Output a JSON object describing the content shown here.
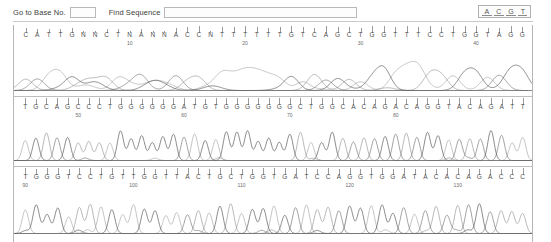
{
  "toolbar": {
    "goto_label": "Go to Base No.",
    "goto_value": "",
    "goto_placeholder": "",
    "find_label": "Find Sequence",
    "find_value": "",
    "find_placeholder": "",
    "nucleotide_buttons": [
      {
        "name": "adenine-button",
        "label": "A"
      },
      {
        "name": "cytosine-button",
        "label": "C"
      },
      {
        "name": "guanine-button",
        "label": "G"
      },
      {
        "name": "thymine-button",
        "label": "T"
      }
    ]
  },
  "accent_colors": {
    "trace_a": "#6e6e6e",
    "trace_c": "#8f8f8f",
    "trace_g": "#4a4a4a",
    "trace_t": "#a3a3a3",
    "panel_border": "#b6b6b6",
    "text": "#4f4f4f"
  },
  "chart_data": {
    "type": "line",
    "title": "",
    "xlabel": "Base number",
    "ylabel": "Fluorescence intensity",
    "grid": false,
    "legend": "none",
    "rows": [
      {
        "row": 1,
        "start_base": 1,
        "end_base": 45,
        "tick_labels": [
          10,
          20,
          30,
          40
        ],
        "sequence": "CATTGNNCTNANNACCNTTTTTGTCAGCTGGTTTCCTGGTAGG",
        "bases": [
          "C",
          "A",
          "T",
          "T",
          "G",
          "N",
          "N",
          "C",
          "T",
          "N",
          "A",
          "N",
          "N",
          "A",
          "C",
          "C",
          "N",
          "T",
          "T",
          "T",
          "T",
          "T",
          "T",
          "G",
          "T",
          "C",
          "A",
          "G",
          "C",
          "T",
          "G",
          "G",
          "T",
          "T",
          "T",
          "C",
          "C",
          "T",
          "G",
          "G",
          "T",
          "A",
          "G",
          "G"
        ],
        "quality": "low - broad merged peaks, several ambiguous N calls near the run start"
      },
      {
        "row": 2,
        "start_base": 45,
        "end_base": 90,
        "tick_labels": [
          50,
          60,
          70,
          80
        ],
        "sequence": "TGCAGCCCTGGGGGGATGTGGGGGGCTGGCACAGACAGGTACAGATT",
        "bases": [
          "T",
          "G",
          "C",
          "A",
          "G",
          "C",
          "C",
          "C",
          "T",
          "G",
          "G",
          "G",
          "G",
          "G",
          "G",
          "A",
          "T",
          "G",
          "T",
          "G",
          "G",
          "G",
          "G",
          "G",
          "G",
          "G",
          "C",
          "T",
          "G",
          "G",
          "C",
          "A",
          "C",
          "A",
          "G",
          "A",
          "C",
          "A",
          "G",
          "G",
          "T",
          "A",
          "C",
          "A",
          "G",
          "A",
          "T",
          "T"
        ],
        "quality": "good - sharp evenly spaced peaks"
      },
      {
        "row": 3,
        "start_base": 90,
        "end_base": 135,
        "tick_labels": [
          90,
          100,
          110,
          120,
          130
        ],
        "sequence": "TGGGTCCTGTTGGTTACTGCTGGTGATCCAGGTGGATACACAGACCC",
        "bases": [
          "T",
          "G",
          "G",
          "G",
          "T",
          "C",
          "C",
          "T",
          "G",
          "T",
          "T",
          "G",
          "G",
          "T",
          "T",
          "A",
          "C",
          "T",
          "G",
          "C",
          "T",
          "G",
          "G",
          "T",
          "G",
          "A",
          "T",
          "C",
          "C",
          "A",
          "G",
          "G",
          "T",
          "G",
          "G",
          "A",
          "T",
          "A",
          "C",
          "A",
          "C",
          "A",
          "G",
          "A",
          "C",
          "C",
          "C"
        ],
        "quality": "good - sharp evenly spaced peaks"
      }
    ]
  }
}
